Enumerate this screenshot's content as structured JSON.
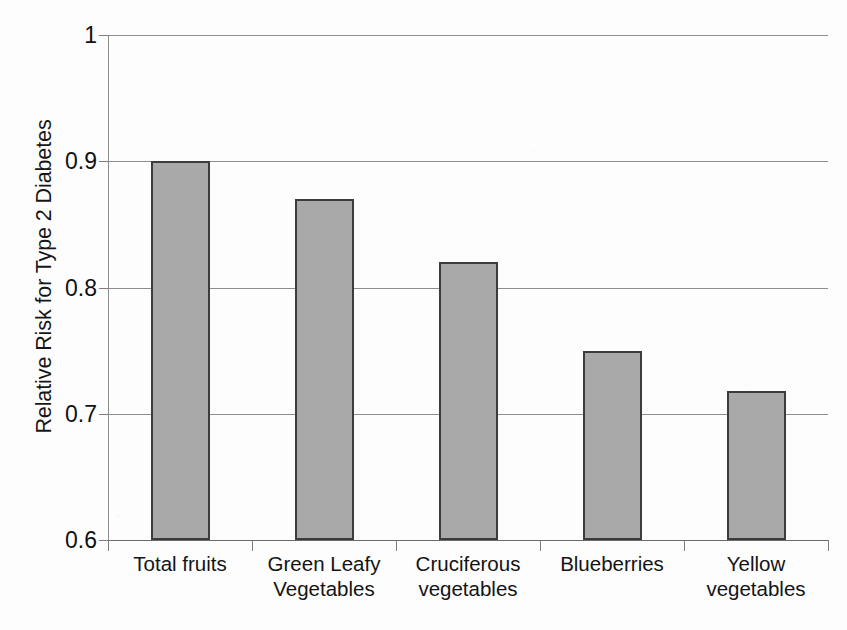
{
  "chart_data": {
    "type": "bar",
    "title": "",
    "xlabel": "",
    "ylabel": "Relative Risk for Type 2 Diabetes",
    "ylim": [
      0.6,
      1.0
    ],
    "ytick_labels": [
      "1",
      "0.9",
      "0.8",
      "0.7",
      "0.6"
    ],
    "ytick_values": [
      1.0,
      0.9,
      0.8,
      0.7,
      0.6
    ],
    "grid": "horizontal",
    "legend": "none",
    "categories": [
      "Total fruits",
      "Green Leafy Vegetables",
      "Cruciferous vegetables",
      "Blueberries",
      "Yellow vegetables"
    ],
    "category_lines": [
      [
        "Total fruits",
        ""
      ],
      [
        "Green Leafy",
        "Vegetables"
      ],
      [
        "Cruciferous",
        "vegetables"
      ],
      [
        "Blueberries",
        ""
      ],
      [
        "Yellow",
        "vegetables"
      ]
    ],
    "values": [
      0.9,
      0.87,
      0.82,
      0.75,
      0.718
    ],
    "bar_color": "#a9a9a9",
    "bar_border_color": "#3c3c3c",
    "axis_color": "#8d8d8d",
    "text_color": "#141414",
    "background": "#fdfdfd"
  }
}
